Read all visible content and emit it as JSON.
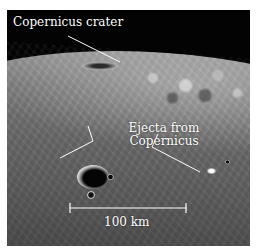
{
  "figure": {
    "labels": {
      "crater": "Copernicus crater",
      "ejecta_line1": "Ejecta from",
      "ejecta_line2": "Copernicus",
      "scale": "100 km"
    },
    "colors": {
      "sky": "#030303",
      "surface_light": "#9a9a9a",
      "surface_dark": "#1a1a1a",
      "annotation": "#ffffff",
      "page_background": "#ffffff"
    }
  }
}
